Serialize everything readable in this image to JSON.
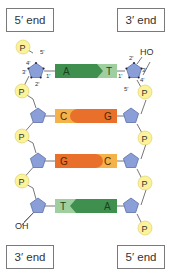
{
  "labels": {
    "top_left": "5′ end",
    "top_right": "3′ end",
    "bottom_left": "3′ end",
    "bottom_right": "5′ end"
  },
  "groups": {
    "phosphate": "P",
    "hydroxyl_top": "HO",
    "hydroxyl_bottom": "OH"
  },
  "carbons": {
    "c1": "1′",
    "c2": "2′",
    "c3": "3′",
    "c4": "4′",
    "c5": "5′"
  },
  "base_pairs": [
    {
      "left": "A",
      "right": "T",
      "type": "AT"
    },
    {
      "left": "C",
      "right": "G",
      "type": "CG"
    },
    {
      "left": "G",
      "right": "C",
      "type": "GC"
    },
    {
      "left": "T",
      "right": "A",
      "type": "TA"
    }
  ],
  "colors": {
    "A": "#3f8f4f",
    "T": "#9fcf9f",
    "C": "#f5b24a",
    "G": "#e8702a",
    "sugar": "#8a9fd8",
    "phosphate": "#fbf29a",
    "box_border": "#7a7a7a"
  }
}
